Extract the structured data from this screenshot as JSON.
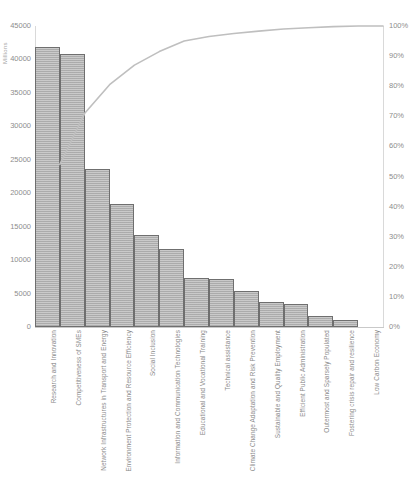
{
  "chart_data": {
    "type": "bar",
    "title": "",
    "subtitle": "",
    "xlabel": "",
    "ylabel": "Millions",
    "y2label": "",
    "ylim": [
      0,
      45000
    ],
    "y2lim": [
      0,
      100
    ],
    "grid": false,
    "legend": "none",
    "y_ticks": [
      "0",
      "5000",
      "10000",
      "15000",
      "20000",
      "25000",
      "30000",
      "35000",
      "40000",
      "45000"
    ],
    "y_tick_values": [
      0,
      5000,
      10000,
      15000,
      20000,
      25000,
      30000,
      35000,
      40000,
      45000
    ],
    "y2_ticks": [
      "0%",
      "10%",
      "20%",
      "30%",
      "40%",
      "50%",
      "60%",
      "70%",
      "80%",
      "90%",
      "100%"
    ],
    "y2_tick_values": [
      0,
      10,
      20,
      30,
      40,
      50,
      60,
      70,
      80,
      90,
      100
    ],
    "categories": [
      "Research and Innovation",
      "Competitiveness of SMEs",
      "Network Infrastructures in Transport and Energy",
      "Environment Protection and Resource Efficiency",
      "Social Inclusion",
      "Information and Communication Technologies",
      "Educational and Vocational Training",
      "Technical assistance",
      "Climate Change Adaptation and Risk Prevention",
      "Sustainable and Quality Employment",
      "Efficient Public Administration",
      "Outermost and Sparsely Populated",
      "Fostering crisis repair and resilience",
      "Low Carbon Economy"
    ],
    "series": [
      {
        "name": "Amount",
        "type": "bar",
        "axis": "left",
        "units": "Millions",
        "values": [
          41800,
          40800,
          23600,
          18400,
          13800,
          11700,
          7300,
          7200,
          5400,
          3700,
          3500,
          1600,
          1000,
          0
        ]
      },
      {
        "name": "Cumulative",
        "type": "line",
        "axis": "right",
        "units": "%",
        "values": [
          54.0,
          71.0,
          80.5,
          87.0,
          91.5,
          95.0,
          96.5,
          97.5,
          98.3,
          99.0,
          99.4,
          99.8,
          100.0,
          100.0
        ]
      }
    ],
    "colors": {
      "bar_fill": "#b3b3b3",
      "bar_border": "#6f6f6f",
      "line": "#bfbfbf",
      "axis": "#d9d9d9",
      "text": "#8a8a8a",
      "background": "#ffffff"
    }
  }
}
